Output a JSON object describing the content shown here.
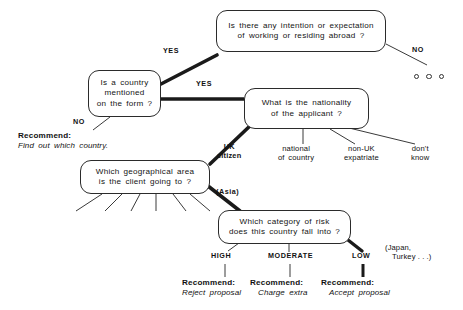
{
  "diagram": {
    "type": "decision-tree",
    "title": "",
    "nodes": {
      "intention": {
        "line1": "Is there any intention or expectation",
        "line2": "of working or residing abroad ?"
      },
      "country_mentioned": {
        "line1": "Is a country",
        "line2": "mentioned",
        "line3": "on the form ?"
      },
      "nationality": {
        "line1": "What is the nationality",
        "line2": "of the applicant ?"
      },
      "geographical_area": {
        "line1": "Which geographical area",
        "line2": "is the client going to ?"
      },
      "risk_category": {
        "line1": "Which category of risk",
        "line2": "does this country fall into ?"
      }
    },
    "branch_labels": {
      "yes_upper": "YES",
      "yes_lower": "YES",
      "no_top_right": "NO",
      "no_left": "NO",
      "uk_citizen_l1": "UK",
      "uk_citizen_l2": "citizen",
      "national_l1": "national",
      "national_l2": "of country",
      "nonuk_l1": "non-UK",
      "nonuk_l2": "expatriate",
      "dontknow_l1": "don't",
      "dontknow_l2": "know",
      "asia": "(Asia)",
      "high": "HIGH",
      "moderate": "MODERATE",
      "low": "LOW"
    },
    "recommendations": {
      "find_country": {
        "head": "Recommend:",
        "body": "Find out which country."
      },
      "reject": {
        "head": "Recommend:",
        "body": "Reject  proposal"
      },
      "charge": {
        "head": "Recommend:",
        "body": "Charge  extra"
      },
      "accept": {
        "head": "Recommend:",
        "body": "Accept  proposal"
      }
    },
    "annotations": {
      "low_examples_l1": "(Japan,",
      "low_examples_l2": "Turkey . . .)"
    },
    "colors": {
      "ink": "#2b2b2b",
      "highlight": "#1a1a1a",
      "background": "#ffffff"
    }
  }
}
